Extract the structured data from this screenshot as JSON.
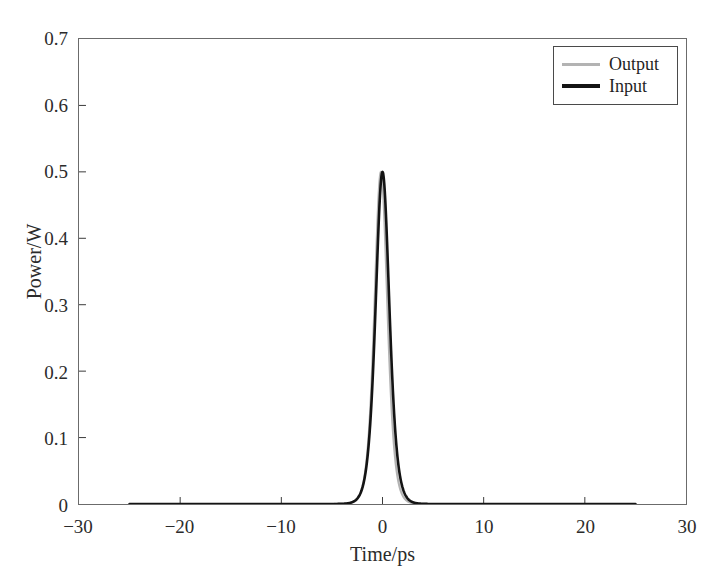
{
  "chart_data": {
    "type": "line",
    "title": "",
    "xlabel": "Time/ps",
    "ylabel": "Power/W",
    "xlim": [
      -30,
      30
    ],
    "ylim": [
      0,
      0.7
    ],
    "xticks": [
      -30,
      -20,
      -10,
      0,
      10,
      20,
      30
    ],
    "xtick_labels": [
      "−30",
      "−20",
      "−10",
      "0",
      "10",
      "20",
      "30"
    ],
    "yticks": [
      0,
      0.1,
      0.2,
      0.3,
      0.4,
      0.5,
      0.6,
      0.7
    ],
    "ytick_labels": [
      "0",
      "0.1",
      "0.2",
      "0.3",
      "0.4",
      "0.5",
      "0.6",
      "0.7"
    ],
    "grid": false,
    "legend_position": "upper right",
    "series": [
      {
        "name": "Output",
        "color": "#b3b3b3",
        "linewidth": 2.2,
        "peak_value": 0.5,
        "peak_time": -0.15,
        "fwhm_ps": 1.5,
        "x_start": -25,
        "x_end": 25,
        "profile": "sech2",
        "x": [
          -25,
          -20,
          -15,
          -10,
          -8,
          -6,
          -5,
          -4,
          -3.5,
          -3,
          -2.5,
          -2.2,
          -2,
          -1.8,
          -1.6,
          -1.4,
          -1.2,
          -1,
          -0.8,
          -0.6,
          -0.4,
          -0.3,
          -0.15,
          0,
          0.2,
          0.4,
          0.6,
          0.8,
          1,
          1.2,
          1.4,
          1.6,
          1.8,
          2,
          2.2,
          2.5,
          3,
          3.5,
          4,
          5,
          6,
          8,
          10,
          15,
          20,
          25
        ],
        "y": [
          0,
          0,
          0,
          0,
          0.0002,
          0.0009,
          0.0021,
          0.005,
          0.0078,
          0.0121,
          0.0188,
          0.0244,
          0.0291,
          0.0349,
          0.0418,
          0.0504,
          0.0612,
          0.0755,
          0.0958,
          0.127,
          0.1805,
          0.2255,
          0.3189,
          0.419,
          0.4769,
          0.4615,
          0.3937,
          0.3063,
          0.2262,
          0.1616,
          0.1128,
          0.0778,
          0.0533,
          0.0364,
          0.0248,
          0.0139,
          0.0058,
          0.0024,
          0.001,
          0.0002,
          0,
          0,
          0,
          0,
          0,
          0
        ]
      },
      {
        "name": "Input",
        "color": "#141414",
        "linewidth": 2.6,
        "peak_value": 0.5,
        "peak_time": 0,
        "fwhm_ps": 1.6,
        "x_start": -25,
        "x_end": 25,
        "profile": "sech2",
        "x": [
          -25,
          -20,
          -15,
          -10,
          -8,
          -6,
          -5,
          -4,
          -3.5,
          -3,
          -2.5,
          -2.2,
          -2,
          -1.8,
          -1.6,
          -1.4,
          -1.2,
          -1,
          -0.8,
          -0.6,
          -0.4,
          -0.2,
          0,
          0.2,
          0.4,
          0.6,
          0.8,
          1,
          1.2,
          1.4,
          1.6,
          1.8,
          2,
          2.2,
          2.5,
          3,
          3.5,
          4,
          5,
          6,
          8,
          10,
          15,
          20,
          25
        ],
        "y": [
          0,
          0,
          0,
          0,
          0.0003,
          0.0013,
          0.0029,
          0.0065,
          0.0099,
          0.015,
          0.0228,
          0.0292,
          0.0346,
          0.041,
          0.0487,
          0.0581,
          0.0696,
          0.0844,
          0.1048,
          0.1345,
          0.1814,
          0.2872,
          0.5,
          0.2872,
          0.1814,
          0.1345,
          0.1048,
          0.0844,
          0.0696,
          0.0581,
          0.0487,
          0.041,
          0.0346,
          0.0292,
          0.0228,
          0.015,
          0.0099,
          0.0065,
          0.0029,
          0.0013,
          0.0003,
          0,
          0,
          0,
          0
        ]
      }
    ]
  },
  "legend": {
    "entries": [
      {
        "label": "Output",
        "color": "#b3b3b3"
      },
      {
        "label": "Input",
        "color": "#141414"
      }
    ]
  },
  "axes": {
    "frame_color": "#6b6b6b",
    "tick_color": "#3a3a3a"
  }
}
